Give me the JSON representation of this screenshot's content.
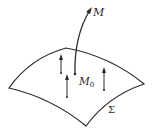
{
  "diagram": {
    "type": "surface-with-normals",
    "labels": {
      "point_M": "M",
      "point_M0_main": "M",
      "point_M0_sub": "0",
      "surface": "Σ"
    },
    "colors": {
      "stroke": "#2a2a2a",
      "background": "#ffffff"
    },
    "elements": {
      "surface": "curved surface patch Σ",
      "curve": "curve from M0 on surface rising to point M",
      "normal_arrows_count": 3
    }
  }
}
